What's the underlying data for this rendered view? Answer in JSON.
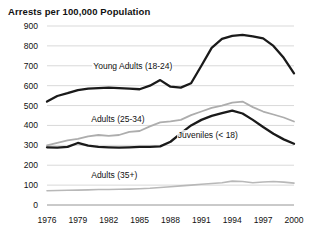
{
  "chart_data": {
    "type": "line",
    "title": "Arrests per 100,000 Population",
    "xlabel": "",
    "ylabel": "",
    "xlim": [
      1976,
      2000
    ],
    "ylim": [
      0,
      900
    ],
    "grid": true,
    "legend_position": "inline-annotations",
    "x_ticks": [
      "1976",
      "1979",
      "1982",
      "1985",
      "1988",
      "1991",
      "1994",
      "1997",
      "2000"
    ],
    "y_ticks": [
      "0",
      "100",
      "200",
      "300",
      "400",
      "500",
      "600",
      "700",
      "800",
      "900"
    ],
    "x": [
      1976,
      1977,
      1978,
      1979,
      1980,
      1981,
      1982,
      1983,
      1984,
      1985,
      1986,
      1987,
      1988,
      1989,
      1990,
      1991,
      1992,
      1993,
      1994,
      1995,
      1996,
      1997,
      1998,
      1999,
      2000
    ],
    "series": [
      {
        "name": "Young Adults (18-24)",
        "color": "#1a1a1a",
        "width": 2.3,
        "label_x": 1980.4,
        "label_y": 700,
        "values": [
          520,
          548,
          562,
          578,
          585,
          588,
          590,
          588,
          585,
          582,
          600,
          628,
          595,
          590,
          612,
          700,
          790,
          835,
          850,
          855,
          848,
          838,
          800,
          740,
          662
        ]
      },
      {
        "name": "Adults (25-34)",
        "color": "#adadad",
        "width": 1.8,
        "label_x": 1980.2,
        "label_y": 432,
        "values": [
          300,
          312,
          325,
          332,
          345,
          352,
          348,
          352,
          368,
          372,
          395,
          415,
          420,
          428,
          452,
          470,
          488,
          500,
          515,
          520,
          492,
          470,
          455,
          440,
          420
        ]
      },
      {
        "name": "Juveniles (< 18)",
        "color": "#1a1a1a",
        "width": 2.3,
        "label_x": 1988.6,
        "label_y": 352,
        "values": [
          290,
          288,
          292,
          312,
          298,
          292,
          290,
          288,
          290,
          292,
          292,
          295,
          318,
          360,
          400,
          428,
          448,
          462,
          475,
          460,
          428,
          392,
          358,
          330,
          308
        ]
      },
      {
        "name": "Adults (35+)",
        "color": "#b8b8b8",
        "width": 1.6,
        "label_x": 1980.2,
        "label_y": 152,
        "values": [
          72,
          73,
          74,
          75,
          76,
          78,
          78,
          79,
          80,
          82,
          84,
          88,
          92,
          96,
          100,
          104,
          108,
          112,
          120,
          118,
          112,
          116,
          118,
          115,
          110
        ]
      }
    ]
  }
}
